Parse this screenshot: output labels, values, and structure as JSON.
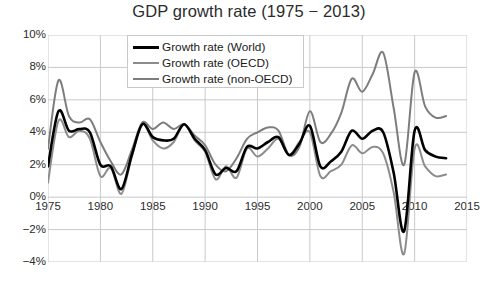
{
  "chart_data": {
    "type": "line",
    "title": "GDP growth rate (1975 − 2013)",
    "xlabel": "",
    "ylabel": "",
    "xlim": [
      1975,
      2015
    ],
    "ylim": [
      -4,
      10
    ],
    "grid": true,
    "legend_position": "top-center-inside",
    "x_ticks": [
      "1975",
      "1980",
      "1985",
      "1990",
      "1995",
      "2000",
      "2005",
      "2010",
      "2015"
    ],
    "x_tick_values": [
      1975,
      1980,
      1985,
      1990,
      1995,
      2000,
      2005,
      2010,
      2015
    ],
    "y_ticks": [
      "10%",
      "8%",
      "6%",
      "4%",
      "2%",
      "0%",
      "-2%",
      "-4%"
    ],
    "y_tick_values": [
      10,
      8,
      6,
      4,
      2,
      0,
      -2,
      -4
    ],
    "x": [
      1975,
      1976,
      1977,
      1978,
      1979,
      1980,
      1981,
      1982,
      1983,
      1984,
      1985,
      1986,
      1987,
      1988,
      1989,
      1990,
      1991,
      1992,
      1993,
      1994,
      1995,
      1996,
      1997,
      1998,
      1999,
      2000,
      2001,
      2002,
      2003,
      2004,
      2005,
      2006,
      2007,
      2008,
      2009,
      2010,
      2011,
      2012,
      2013
    ],
    "series": [
      {
        "name": "Growth rate (World)",
        "color": "#000000",
        "width": 2.6,
        "values": [
          1.9,
          5.3,
          4.1,
          4.2,
          4.0,
          2.0,
          1.9,
          0.5,
          2.6,
          4.5,
          3.7,
          3.5,
          3.6,
          4.5,
          3.6,
          2.9,
          1.4,
          1.8,
          1.6,
          3.1,
          3.0,
          3.4,
          3.7,
          2.6,
          3.3,
          4.4,
          1.9,
          2.2,
          2.8,
          4.1,
          3.6,
          4.1,
          4.0,
          1.5,
          -2.1,
          4.1,
          2.9,
          2.5,
          2.4
        ],
        "display_values": [
          1.9,
          5.3,
          4.1,
          4.2,
          4.0,
          2.0,
          1.9,
          0.5,
          2.6,
          4.5,
          3.7,
          3.5,
          3.6,
          4.5,
          3.6,
          2.9,
          1.4,
          1.8,
          1.6,
          3.1,
          3.0,
          3.4,
          3.7,
          2.6,
          3.3,
          4.4,
          1.9,
          2.2,
          2.8,
          4.1,
          3.6,
          4.1,
          4.0,
          1.5,
          -2.1,
          4.1,
          2.9,
          2.5,
          2.4
        ]
      },
      {
        "name": "Growth rate (OECD)",
        "color": "#8c8c8c",
        "width": 2.0,
        "values": [
          0.9,
          4.7,
          3.7,
          4.1,
          3.6,
          1.3,
          1.8,
          0.2,
          2.5,
          4.5,
          3.5,
          3.0,
          3.4,
          4.5,
          3.5,
          2.8,
          1.1,
          1.9,
          1.2,
          3.0,
          2.5,
          3.0,
          3.6,
          2.6,
          3.4,
          4.0,
          1.3,
          1.6,
          2.0,
          3.2,
          2.7,
          3.1,
          2.7,
          0.3,
          -3.5,
          3.0,
          1.9,
          1.3,
          1.4
        ],
        "display_values": [
          0.9,
          4.7,
          3.7,
          4.1,
          3.6,
          1.3,
          1.8,
          0.2,
          2.5,
          4.5,
          3.5,
          3.0,
          3.4,
          4.5,
          3.5,
          2.8,
          1.1,
          1.9,
          1.2,
          3.0,
          2.5,
          3.0,
          3.6,
          2.6,
          3.4,
          4.0,
          1.3,
          1.6,
          2.0,
          3.2,
          2.7,
          3.1,
          2.7,
          0.3,
          -3.5,
          3.0,
          1.9,
          1.3,
          1.4
        ]
      },
      {
        "name": "Growth rate (non-OECD)",
        "color": "#7d7d7d",
        "width": 2.0,
        "values": [
          3.0,
          7.2,
          5.0,
          4.6,
          4.8,
          3.4,
          2.2,
          1.4,
          2.9,
          4.6,
          4.2,
          4.6,
          4.2,
          4.5,
          3.8,
          3.2,
          2.0,
          1.6,
          2.4,
          3.6,
          4.0,
          4.3,
          4.1,
          2.6,
          3.1,
          5.3,
          3.4,
          3.9,
          5.2,
          7.3,
          6.5,
          7.6,
          8.9,
          5.5,
          2.0,
          7.7,
          5.6,
          4.9,
          5.0
        ],
        "display_values": [
          3.0,
          7.2,
          5.0,
          4.6,
          4.8,
          3.4,
          2.2,
          1.4,
          2.9,
          4.6,
          4.2,
          4.6,
          4.2,
          4.5,
          3.8,
          3.2,
          2.0,
          1.6,
          2.4,
          3.6,
          4.0,
          4.3,
          4.1,
          2.6,
          3.1,
          5.3,
          3.4,
          3.9,
          5.2,
          7.3,
          6.5,
          7.6,
          8.9,
          5.5,
          2.0,
          7.7,
          5.6,
          4.9,
          5.0
        ]
      }
    ]
  },
  "legend": {
    "items": [
      {
        "label": "Growth rate (World)",
        "color": "#000000"
      },
      {
        "label": "Growth rate (OECD)",
        "color": "#8c8c8c"
      },
      {
        "label": "Growth rate (non-OECD)",
        "color": "#7d7d7d"
      }
    ]
  },
  "style": {
    "grid_color": "#c9c9c9",
    "axis_color": "#b0b0b0",
    "text_color": "#2b2b2b",
    "background": "#ffffff"
  }
}
